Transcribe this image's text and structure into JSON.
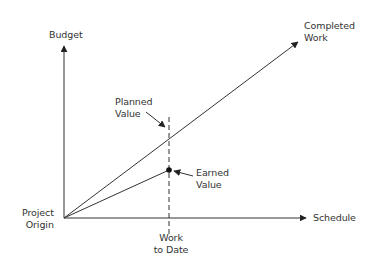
{
  "diagram": {
    "type": "earned-value-chart",
    "axes": {
      "y_label": "Budget",
      "x_label": "Schedule"
    },
    "origin_label": [
      "Project",
      "Origin"
    ],
    "lines": [
      {
        "name": "Completed Work",
        "label": [
          "Completed",
          "Work"
        ]
      },
      {
        "name": "Earned Value",
        "label": [
          "Earned",
          "Value"
        ]
      }
    ],
    "markers": {
      "planned_value": [
        "Planned",
        "Value"
      ],
      "earned_value": [
        "Earned",
        "Value"
      ],
      "work_to_date": [
        "Work",
        "to Date"
      ]
    },
    "colors": {
      "line": "#333333",
      "text": "#333333",
      "background": "#ffffff"
    }
  }
}
